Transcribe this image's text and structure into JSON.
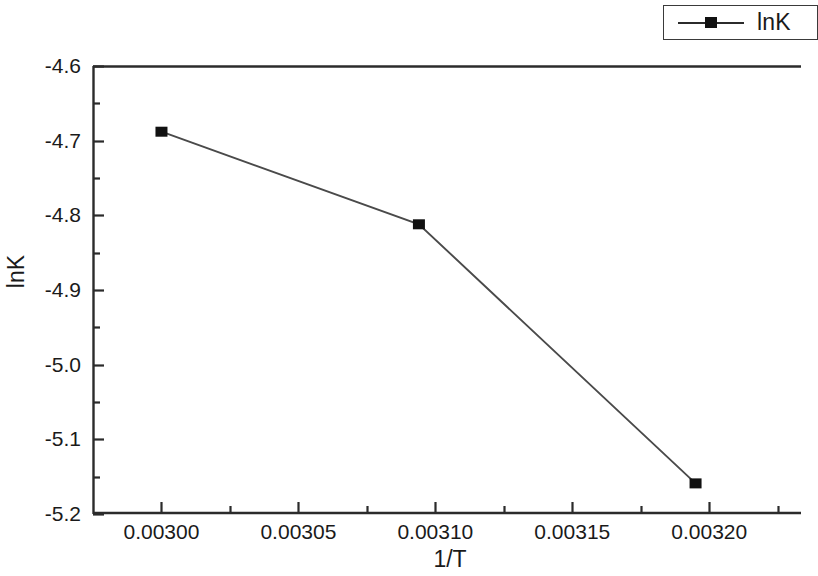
{
  "chart_data": {
    "type": "line",
    "title": "",
    "xlabel": "1/T",
    "ylabel": "lnK",
    "xlim": [
      0.002975,
      0.0032335
    ],
    "ylim": [
      -5.2,
      -4.6
    ],
    "grid": false,
    "legend_position": "top-right-outside",
    "series": [
      {
        "name": "lnK",
        "marker": "filled-square",
        "color": "#111111",
        "x": [
          0.003,
          0.003094,
          0.003195
        ],
        "y": [
          -4.688,
          -4.812,
          -5.159
        ],
        "points": [
          {
            "x": 0.003,
            "y": -4.688
          },
          {
            "x": 0.003094,
            "y": -4.812
          },
          {
            "x": 0.003195,
            "y": -5.159
          }
        ]
      }
    ],
    "xticks": [
      0.003,
      0.00305,
      0.0031,
      0.00315,
      0.0032
    ],
    "xtick_labels": [
      "0.00300",
      "0.00305",
      "0.00310",
      "0.00315",
      "0.00320"
    ],
    "x_minor_ticks_between": 1,
    "yticks": [
      -4.6,
      -4.7,
      -4.8,
      -4.9,
      -5.0,
      -5.1,
      -5.2
    ],
    "ytick_labels": [
      "-4.6",
      "-4.7",
      "-4.8",
      "-4.9",
      "-5.0",
      "-5.1",
      "-5.2"
    ],
    "y_minor_ticks_between": 1
  },
  "legend": {
    "entries": [
      {
        "label": "lnK",
        "marker": "filled-square",
        "color": "#111111"
      }
    ]
  },
  "axes": {
    "x_axis_title": "1/T",
    "y_axis_title": "lnK"
  },
  "colors": {
    "line": "#2b2b2b",
    "marker": "#111111",
    "axis": "#2b2b2b",
    "background": "#ffffff",
    "text": "#1a1a1a"
  }
}
